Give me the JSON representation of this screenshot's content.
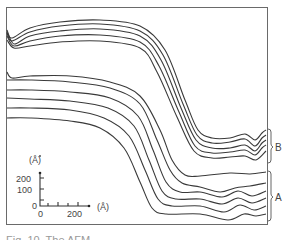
{
  "figure": {
    "caption_partial": "Fig. 10. The AFM ...",
    "group_labels": {
      "upper": "B",
      "lower": "A"
    },
    "inset": {
      "y_unit": "(Å)",
      "x_unit": "(Å)",
      "y_ticks": [
        "200",
        "100",
        "0"
      ],
      "x_ticks": [
        "0",
        "200"
      ]
    },
    "colors": {
      "line": "#3a3a3a",
      "frame": "#6a6a6a",
      "background": "#ffffff"
    }
  },
  "chart_data": {
    "type": "line",
    "title": "",
    "xlabel": "(Å)",
    "ylabel": "(Å)",
    "inset_scale": {
      "x_ticks": [
        0,
        200
      ],
      "y_ticks": [
        0,
        100,
        200
      ]
    },
    "grid": false,
    "groups": [
      {
        "name": "B",
        "series": [
          {
            "name": "B1",
            "points": [
              [
                7,
                32
              ],
              [
                12,
                38
              ],
              [
                30,
                28
              ],
              [
                60,
                22
              ],
              [
                100,
                20
              ],
              [
                140,
                26
              ],
              [
                165,
                50
              ],
              [
                185,
                100
              ],
              [
                198,
                130
              ],
              [
                212,
                138
              ],
              [
                230,
                138
              ],
              [
                245,
                134
              ],
              [
                255,
                140
              ],
              [
                262,
                133
              ],
              [
                266,
                130
              ]
            ]
          },
          {
            "name": "B2",
            "points": [
              [
                7,
                33
              ],
              [
                12,
                41
              ],
              [
                30,
                32
              ],
              [
                60,
                26
              ],
              [
                100,
                24
              ],
              [
                140,
                31
              ],
              [
                163,
                55
              ],
              [
                183,
                104
              ],
              [
                197,
                135
              ],
              [
                212,
                143
              ],
              [
                230,
                142
              ],
              [
                245,
                139
              ],
              [
                255,
                146
              ],
              [
                262,
                138
              ],
              [
                266,
                135
              ]
            ]
          },
          {
            "name": "B3",
            "points": [
              [
                7,
                30
              ],
              [
                14,
                44
              ],
              [
                30,
                36
              ],
              [
                60,
                31
              ],
              [
                100,
                29
              ],
              [
                140,
                36
              ],
              [
                161,
                60
              ],
              [
                181,
                108
              ],
              [
                196,
                140
              ],
              [
                212,
                148
              ],
              [
                230,
                148
              ],
              [
                245,
                145
              ],
              [
                255,
                151
              ],
              [
                262,
                143
              ],
              [
                266,
                140
              ]
            ]
          },
          {
            "name": "B4",
            "points": [
              [
                7,
                36
              ],
              [
                14,
                46
              ],
              [
                30,
                41
              ],
              [
                60,
                36
              ],
              [
                100,
                35
              ],
              [
                140,
                42
              ],
              [
                159,
                66
              ],
              [
                179,
                112
              ],
              [
                195,
                146
              ],
              [
                212,
                153
              ],
              [
                230,
                152
              ],
              [
                245,
                150
              ],
              [
                255,
                155
              ],
              [
                262,
                148
              ],
              [
                266,
                145
              ]
            ]
          },
          {
            "name": "B5",
            "points": [
              [
                7,
                40
              ],
              [
                14,
                48
              ],
              [
                30,
                46
              ],
              [
                60,
                42
              ],
              [
                100,
                41
              ],
              [
                140,
                48
              ],
              [
                157,
                72
              ],
              [
                177,
                117
              ],
              [
                194,
                151
              ],
              [
                212,
                158
              ],
              [
                230,
                157
              ],
              [
                245,
                156
              ],
              [
                256,
                160
              ],
              [
                266,
                151
              ]
            ]
          }
        ]
      },
      {
        "name": "A",
        "series": [
          {
            "name": "A1",
            "points": [
              [
                7,
                72
              ],
              [
                12,
                78
              ],
              [
                30,
                76
              ],
              [
                70,
                76
              ],
              [
                110,
                82
              ],
              [
                140,
                96
              ],
              [
                160,
                130
              ],
              [
                172,
                160
              ],
              [
                185,
                175
              ],
              [
                200,
                176
              ],
              [
                230,
                173
              ],
              [
                250,
                174
              ],
              [
                266,
                172
              ]
            ]
          },
          {
            "name": "A2",
            "points": [
              [
                7,
                80
              ],
              [
                30,
                80
              ],
              [
                70,
                82
              ],
              [
                110,
                88
              ],
              [
                140,
                104
              ],
              [
                157,
                140
              ],
              [
                170,
                170
              ],
              [
                182,
                183
              ],
              [
                200,
                187
              ],
              [
                220,
                192
              ],
              [
                235,
                188
              ],
              [
                250,
                186
              ],
              [
                266,
                183
              ]
            ]
          },
          {
            "name": "A3",
            "points": [
              [
                7,
                90
              ],
              [
                30,
                90
              ],
              [
                70,
                92
              ],
              [
                110,
                98
              ],
              [
                138,
                116
              ],
              [
                153,
                150
              ],
              [
                166,
                182
              ],
              [
                180,
                192
              ],
              [
                200,
                192
              ],
              [
                222,
                197
              ],
              [
                238,
                191
              ],
              [
                252,
                196
              ],
              [
                266,
                191
              ]
            ]
          },
          {
            "name": "A4",
            "points": [
              [
                7,
                98
              ],
              [
                30,
                99
              ],
              [
                70,
                101
              ],
              [
                108,
                108
              ],
              [
                134,
                126
              ],
              [
                149,
                160
              ],
              [
                162,
                191
              ],
              [
                176,
                199
              ],
              [
                200,
                199
              ],
              [
                222,
                204
              ],
              [
                238,
                198
              ],
              [
                252,
                203
              ],
              [
                266,
                198
              ]
            ]
          },
          {
            "name": "A5",
            "points": [
              [
                7,
                108
              ],
              [
                30,
                108
              ],
              [
                70,
                110
              ],
              [
                104,
                118
              ],
              [
                129,
                136
              ],
              [
                145,
                170
              ],
              [
                158,
                199
              ],
              [
                172,
                206
              ],
              [
                200,
                206
              ],
              [
                224,
                212
              ],
              [
                240,
                205
              ],
              [
                254,
                210
              ],
              [
                266,
                206
              ]
            ]
          },
          {
            "name": "A6",
            "points": [
              [
                7,
                118
              ],
              [
                30,
                118
              ],
              [
                70,
                121
              ],
              [
                100,
                128
              ],
              [
                124,
                148
              ],
              [
                140,
                182
              ],
              [
                152,
                208
              ],
              [
                166,
                214
              ],
              [
                200,
                214
              ],
              [
                228,
                220
              ],
              [
                244,
                214
              ],
              [
                256,
                216
              ],
              [
                266,
                214
              ]
            ]
          }
        ]
      }
    ]
  }
}
